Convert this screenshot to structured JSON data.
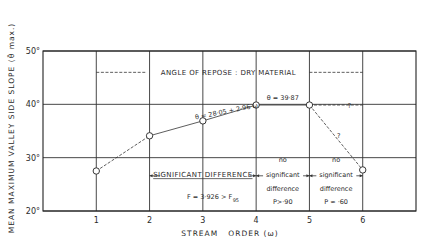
{
  "chart_data": {
    "type": "line",
    "title": "",
    "xlabel": "STREAM   ORDER (ω)",
    "ylabel": "MEAN MAXIMUM VALLEY SIDE SLOPE (θ̄ max.)",
    "xlim": [
      0,
      7
    ],
    "ylim": [
      20,
      50
    ],
    "grid": true,
    "x_ticks": [
      "1",
      "2",
      "3",
      "4",
      "5",
      "6"
    ],
    "y_ticks": [
      "20°",
      "30°",
      "40°",
      "50°"
    ],
    "series": [
      {
        "name": "Mean maximum valley side slope",
        "x": [
          1,
          2,
          3,
          4,
          5,
          6
        ],
        "y": [
          27.5,
          34.1,
          36.9,
          39.87,
          39.87,
          27.7
        ]
      }
    ],
    "reference_line": {
      "label": "ANGLE OF REPOSE : DRY MATERIAL",
      "y": 46,
      "x_range": [
        1,
        6
      ]
    },
    "annotations": {
      "regression": "θ = 28·05 + 2·96 ω",
      "plateau": "θ = 39·87",
      "uncertain_mark": "?",
      "significant": "SIGNIFICANT DIFFERENCE",
      "f_test": "F = 3·926 > F",
      "f_sub": "95",
      "no_sig_1": [
        "no",
        "significant",
        "difference",
        "P>·90"
      ],
      "no_sig_2": [
        "no",
        "significant",
        "difference",
        "P ≈ ·60"
      ]
    }
  }
}
